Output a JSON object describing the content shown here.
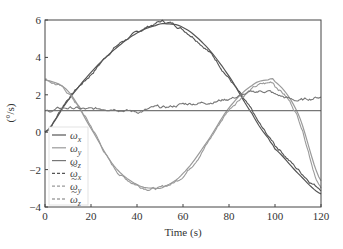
{
  "chart_data": {
    "type": "line",
    "title": "",
    "xlabel": "Time (s)",
    "ylabel": "(°/s)",
    "xlim": [
      0,
      120
    ],
    "ylim": [
      -4,
      6
    ],
    "xticks": [
      0,
      20,
      40,
      60,
      80,
      100,
      120
    ],
    "yticks": [
      -4,
      -2,
      0,
      2,
      4,
      6
    ],
    "grid": false,
    "legend_position": "lower-left inside",
    "x": [
      0,
      10,
      20,
      30,
      40,
      48,
      52,
      60,
      70,
      80,
      90,
      97,
      100,
      110,
      120
    ],
    "series": [
      {
        "name": "ω_x",
        "style": "solid",
        "color": "#555555",
        "values": [
          0.0,
          1.7,
          3.2,
          4.4,
          5.3,
          5.7,
          5.8,
          5.6,
          4.6,
          3.0,
          1.0,
          -0.3,
          -0.9,
          -2.2,
          -3.3
        ]
      },
      {
        "name": "ω_y",
        "style": "solid",
        "color": "#9a9a9a",
        "values": [
          2.8,
          2.2,
          0.2,
          -1.8,
          -2.8,
          -3.0,
          -2.9,
          -2.2,
          -0.6,
          1.3,
          2.5,
          2.8,
          2.7,
          1.0,
          -2.6
        ]
      },
      {
        "name": "ω_z",
        "style": "solid",
        "color": "#777777",
        "values": [
          1.15,
          1.15,
          1.15,
          1.15,
          1.15,
          1.15,
          1.15,
          1.15,
          1.15,
          1.15,
          1.15,
          1.15,
          1.15,
          1.15,
          1.15
        ]
      },
      {
        "name": "ω̃_x",
        "style": "dashed",
        "color": "#555555",
        "values": [
          0.0,
          1.8,
          3.1,
          4.5,
          5.3,
          5.8,
          5.9,
          5.5,
          4.5,
          2.9,
          1.1,
          -0.2,
          -0.7,
          -2.0,
          -3.0
        ]
      },
      {
        "name": "ω̃_y",
        "style": "dashed",
        "color": "#9a9a9a",
        "values": [
          2.8,
          2.1,
          0.3,
          -1.9,
          -2.8,
          -3.0,
          -2.9,
          -2.3,
          -0.7,
          1.2,
          2.3,
          2.6,
          2.5,
          0.8,
          -3.0
        ]
      },
      {
        "name": "ω̃_z",
        "style": "dashed",
        "color": "#777777",
        "values": [
          1.1,
          1.3,
          1.2,
          1.3,
          1.1,
          1.3,
          1.3,
          1.5,
          1.6,
          1.8,
          2.1,
          2.2,
          2.0,
          1.7,
          1.9
        ]
      }
    ]
  },
  "axes": {
    "xlabel": "Time (s)",
    "ylabel": "(°/s)",
    "xtick_labels": [
      "0",
      "20",
      "40",
      "60",
      "80",
      "100",
      "120"
    ],
    "ytick_labels": [
      "−4",
      "−2",
      "0",
      "2",
      "4",
      "6"
    ]
  },
  "legend": {
    "items": [
      {
        "label": "ωx",
        "base": "ω",
        "sub": "x",
        "tilde": false,
        "dash": false,
        "color": "#555555"
      },
      {
        "label": "ωy",
        "base": "ω",
        "sub": "y",
        "tilde": false,
        "dash": false,
        "color": "#9a9a9a"
      },
      {
        "label": "ωz",
        "base": "ω",
        "sub": "z",
        "tilde": false,
        "dash": false,
        "color": "#777777"
      },
      {
        "label": "ω̃x",
        "base": "ω",
        "sub": "x",
        "tilde": true,
        "dash": true,
        "color": "#555555"
      },
      {
        "label": "ω̃y",
        "base": "ω",
        "sub": "y",
        "tilde": true,
        "dash": true,
        "color": "#9a9a9a"
      },
      {
        "label": "ω̃z",
        "base": "ω",
        "sub": "z",
        "tilde": true,
        "dash": true,
        "color": "#777777"
      }
    ]
  }
}
